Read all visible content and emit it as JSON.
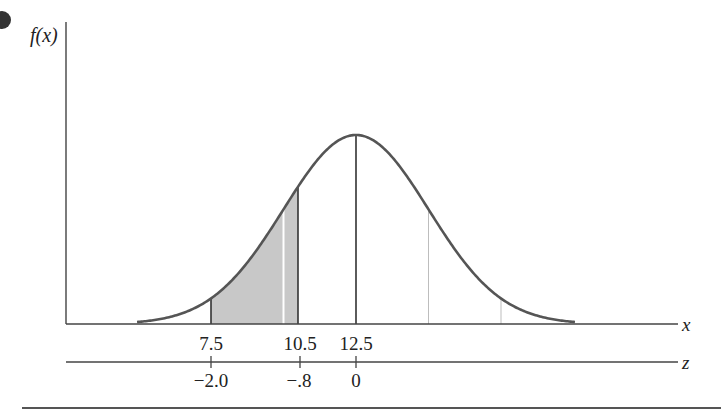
{
  "chart_data": {
    "type": "area",
    "title": "",
    "ylabel": "f(x)",
    "xlabel": "x",
    "zlabel": "z",
    "distribution": {
      "name": "normal",
      "mean": 12.5,
      "sd": 2.5
    },
    "shaded_region": {
      "x_from": 7.5,
      "x_to": 10.5,
      "z_from": -2.0,
      "z_to": -0.8
    },
    "x_ticks": [
      "7.5",
      "10.5",
      "12.5"
    ],
    "z_ticks": [
      "−2.0",
      "−.8",
      "0"
    ],
    "x_tick_values": [
      7.5,
      10.5,
      12.5
    ],
    "z_tick_values": [
      -2.0,
      -0.8,
      0
    ],
    "guide_lines_x": [
      10.0,
      15.0,
      17.5
    ],
    "grid": false,
    "legend": null
  },
  "labels": {
    "y_axis": "f(x)",
    "x_axis": "x",
    "z_axis": "z",
    "x_tick_0": "7.5",
    "x_tick_1": "10.5",
    "x_tick_2": "12.5",
    "z_tick_0": "−2.0",
    "z_tick_1": "−.8",
    "z_tick_2": "0"
  },
  "colors": {
    "curve": "#555555",
    "shade": "#c8c8c8",
    "axis": "#444444",
    "guide": "#bdbdbd"
  }
}
